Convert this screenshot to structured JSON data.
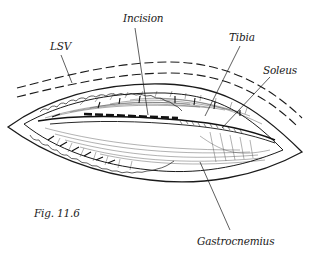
{
  "figure": {
    "caption": "Fig. 11.6",
    "labels": {
      "lsv": "LSV",
      "incision": "Incision",
      "tibia": "Tibia",
      "soleus": "Soleus",
      "gastrocnemius": "Gastrocnemius"
    },
    "colors": {
      "ink": "#1a1a1a",
      "background": "#ffffff"
    }
  }
}
